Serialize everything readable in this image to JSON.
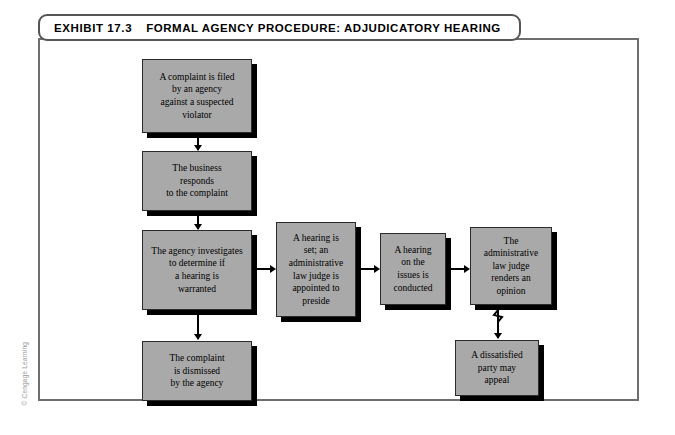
{
  "exhibit": {
    "number_label": "EXHIBIT 17.3",
    "title": "FORMAL AGENCY PROCEDURE: ADJUDICATORY HEARING"
  },
  "credit": {
    "text": "© Cengage Learning"
  },
  "colors": {
    "node_fill": "#a9a9a9",
    "node_border": "#2b2b2b",
    "node_shadow": "#000000",
    "frame_border": "#6e6e6e",
    "connector": "#000000",
    "page_background": "#ffffff"
  },
  "flowchart": {
    "nodes": [
      {
        "id": "complaint-filed",
        "lines": [
          "A complaint is filed",
          "by an agency",
          "against a suspected",
          "violator"
        ]
      },
      {
        "id": "business-responds",
        "lines": [
          "The business",
          "responds",
          "to the complaint"
        ]
      },
      {
        "id": "agency-investigates",
        "lines": [
          "The agency investigates",
          "to determine if",
          "a hearing is",
          "warranted"
        ]
      },
      {
        "id": "complaint-dismissed",
        "lines": [
          "The complaint",
          "is dismissed",
          "by the agency"
        ]
      },
      {
        "id": "hearing-set",
        "lines": [
          "A hearing is",
          "set; an",
          "administrative",
          "law judge is",
          "appointed to",
          "preside"
        ]
      },
      {
        "id": "hearing-conducted",
        "lines": [
          "A hearing",
          "on the",
          "issues is",
          "conducted"
        ]
      },
      {
        "id": "judge-renders-opinion",
        "lines": [
          "The",
          "administrative",
          "law judge",
          "renders an",
          "opinion"
        ]
      },
      {
        "id": "party-may-appeal",
        "lines": [
          "A dissatisfied",
          "party may",
          "appeal"
        ]
      }
    ],
    "connectors": [
      {
        "from": "complaint-filed",
        "to": "business-responds",
        "direction": "down"
      },
      {
        "from": "business-responds",
        "to": "agency-investigates",
        "direction": "down"
      },
      {
        "from": "agency-investigates",
        "to": "complaint-dismissed",
        "direction": "down"
      },
      {
        "from": "agency-investigates",
        "to": "hearing-set",
        "direction": "right"
      },
      {
        "from": "hearing-set",
        "to": "hearing-conducted",
        "direction": "right"
      },
      {
        "from": "hearing-conducted",
        "to": "judge-renders-opinion",
        "direction": "right"
      },
      {
        "from": "judge-renders-opinion",
        "to": "party-may-appeal",
        "direction": "down",
        "style": "break"
      }
    ]
  }
}
